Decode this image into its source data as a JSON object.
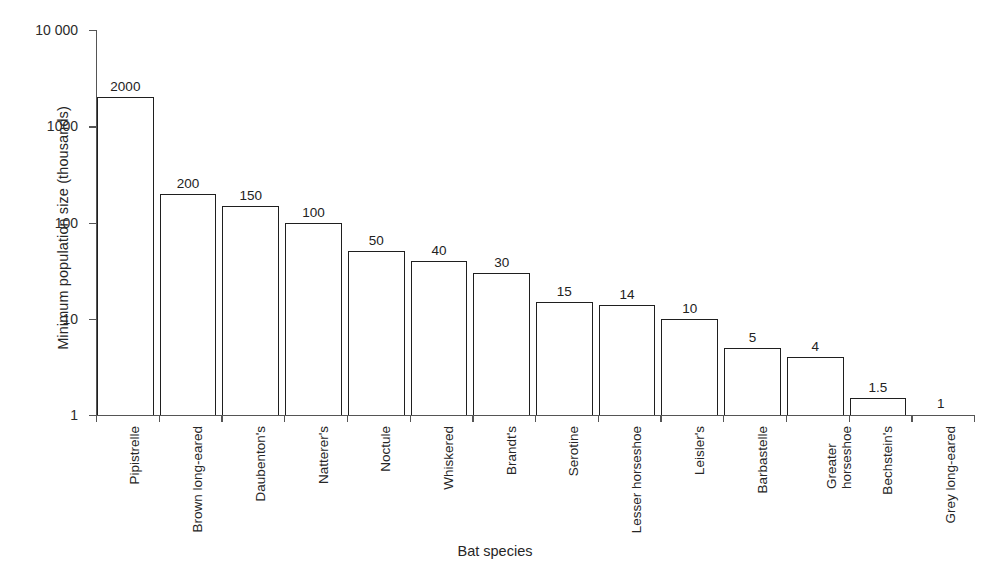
{
  "chart_data": {
    "type": "bar",
    "title": "",
    "xlabel": "Bat species",
    "ylabel": "Minimum population size (thousands)",
    "yscale": "log",
    "ylim": [
      1,
      10000
    ],
    "ytick_labels": [
      "10 000",
      "1000",
      "100",
      "10",
      "1"
    ],
    "ytick_values": [
      10000,
      1000,
      100,
      10,
      1
    ],
    "grid": false,
    "legend": null,
    "bar_style": "outline",
    "bar_color": "#ffffff",
    "bar_edge_color": "#1f1f1f",
    "categories": [
      "Pipistrelle",
      "Brown long-eared",
      "Daubenton's",
      "Natterer's",
      "Noctule",
      "Whiskered",
      "Brandt's",
      "Serotine",
      "Lesser horseshoe",
      "Leisler's",
      "Barbastelle",
      "Greater horseshoe",
      "Bechstein's",
      "Grey long-eared"
    ],
    "category_lines": [
      [
        "Pipistrelle"
      ],
      [
        "Brown long-eared"
      ],
      [
        "Daubenton's"
      ],
      [
        "Natterer's"
      ],
      [
        "Noctule"
      ],
      [
        "Whiskered"
      ],
      [
        "Brandt's"
      ],
      [
        "Serotine"
      ],
      [
        "Lesser horseshoe"
      ],
      [
        "Leisler's"
      ],
      [
        "Barbastelle"
      ],
      [
        "Greater",
        "horseshoe"
      ],
      [
        "Bechstein's"
      ],
      [
        "Grey long-eared"
      ]
    ],
    "values": [
      2000,
      200,
      150,
      100,
      50,
      40,
      30,
      15,
      14,
      10,
      5,
      4,
      1.5,
      1
    ],
    "value_labels": [
      "2000",
      "200",
      "150",
      "100",
      "50",
      "40",
      "30",
      "15",
      "14",
      "10",
      "5",
      "4",
      "1.5",
      "1"
    ]
  }
}
